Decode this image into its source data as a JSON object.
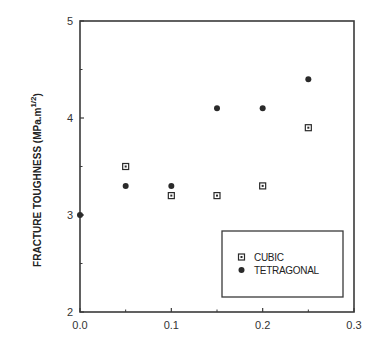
{
  "chart_data": {
    "type": "scatter",
    "title": "",
    "xlabel": "",
    "ylabel": "FRACTURE TOUGHNESS (MPa.m",
    "ylabel_sup": "1/2",
    "ylabel_close": ")",
    "xlim": [
      0.0,
      0.3
    ],
    "ylim": [
      2,
      5
    ],
    "x_ticks": [
      0.0,
      0.1,
      0.2,
      0.3
    ],
    "x_tick_labels": [
      "0.0",
      "0.1",
      "0.2",
      "0.3"
    ],
    "x_minor_ticks": [
      0.05,
      0.15,
      0.25
    ],
    "y_ticks": [
      2,
      3,
      4,
      5
    ],
    "y_tick_labels": [
      "2",
      "3",
      "4",
      "5"
    ],
    "y_minor_ticks": [
      2.5,
      3.5,
      4.5
    ],
    "grid": false,
    "legend_position": "lower right (inside)",
    "series": [
      {
        "name": "CUBIC",
        "marker": "square-dotted",
        "points": [
          {
            "x": 0.05,
            "y": 3.5
          },
          {
            "x": 0.1,
            "y": 3.2
          },
          {
            "x": 0.15,
            "y": 3.2
          },
          {
            "x": 0.2,
            "y": 3.3
          },
          {
            "x": 0.25,
            "y": 3.9
          }
        ]
      },
      {
        "name": "TETRAGONAL",
        "marker": "filled-circle",
        "points": [
          {
            "x": 0.0,
            "y": 3.0
          },
          {
            "x": 0.05,
            "y": 3.3
          },
          {
            "x": 0.1,
            "y": 3.3
          },
          {
            "x": 0.15,
            "y": 4.1
          },
          {
            "x": 0.2,
            "y": 4.1
          },
          {
            "x": 0.25,
            "y": 4.4
          }
        ]
      }
    ]
  },
  "legend": {
    "items": [
      {
        "label": "CUBIC",
        "marker": "square-dotted"
      },
      {
        "label": "TETRAGONAL",
        "marker": "filled-circle"
      }
    ]
  },
  "colors": {
    "axis": "#3a3a3a",
    "marker": "#2a2a2a",
    "text": "#222222"
  }
}
